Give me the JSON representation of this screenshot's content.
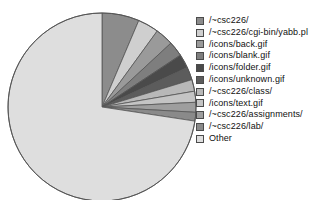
{
  "chart_data": {
    "type": "pie",
    "title": "",
    "subtitle": "",
    "xlabel": "",
    "ylabel": "",
    "grid": false,
    "legend_position": "right",
    "start_angle_deg": 0,
    "direction": "clockwise",
    "categories": [
      "/~csc226/",
      "/~csc226/cgi-bin/yabb.pl",
      "/icons/back.gif",
      "/icons/blank.gif",
      "/icons/folder.gif",
      "/icons/unknown.gif",
      "/~csc226/class/",
      "/icons/text.gif",
      "/~csc226/assignments/",
      "/~csc226/lab/",
      "Other"
    ],
    "values": [
      6.4,
      3.6,
      3.1,
      2.6,
      2.4,
      2.2,
      2.0,
      1.9,
      1.7,
      1.5,
      72.6
    ],
    "colors": [
      "#8c8c8c",
      "#cfcfcf",
      "#9a9a9a",
      "#7e7e7e",
      "#4a4a4a",
      "#5c5c5c",
      "#b8b8b8",
      "#c4c4c4",
      "#9e9e9e",
      "#8a8a8a",
      "#dedede"
    ],
    "slice_border_color": "#555555",
    "pie": {
      "cx": 102,
      "cy": 107,
      "r": 94
    }
  },
  "legend": {
    "items": [
      {
        "label": "/~csc226/",
        "color": "#8c8c8c"
      },
      {
        "label": "/~csc226/cgi-bin/yabb.pl",
        "color": "#cfcfcf"
      },
      {
        "label": "/icons/back.gif",
        "color": "#9a9a9a"
      },
      {
        "label": "/icons/blank.gif",
        "color": "#7e7e7e"
      },
      {
        "label": "/icons/folder.gif",
        "color": "#4a4a4a"
      },
      {
        "label": "/icons/unknown.gif",
        "color": "#5c5c5c"
      },
      {
        "label": "/~csc226/class/",
        "color": "#b8b8b8"
      },
      {
        "label": "/icons/text.gif",
        "color": "#c4c4c4"
      },
      {
        "label": "/~csc226/assignments/",
        "color": "#9e9e9e"
      },
      {
        "label": "/~csc226/lab/",
        "color": "#8a8a8a"
      },
      {
        "label": "Other",
        "color": "#dedede"
      }
    ]
  }
}
